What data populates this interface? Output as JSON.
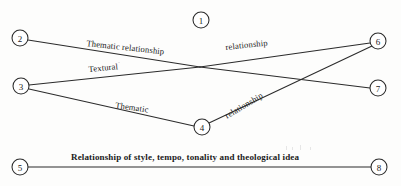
{
  "diagram": {
    "background_color": "#fdfdfc",
    "line_color": "#2b2b2b",
    "text_color": "#1b1b1b",
    "width": 401,
    "height": 186,
    "nodes": [
      {
        "id": "1",
        "label": "1",
        "x": 201,
        "y": 20,
        "r": 8
      },
      {
        "id": "2",
        "label": "2",
        "x": 20,
        "y": 38,
        "r": 8
      },
      {
        "id": "3",
        "label": "3",
        "x": 21,
        "y": 86,
        "r": 8
      },
      {
        "id": "4",
        "label": "4",
        "x": 202,
        "y": 127,
        "r": 8
      },
      {
        "id": "5",
        "label": "5",
        "x": 20,
        "y": 167,
        "r": 8
      },
      {
        "id": "6",
        "label": "6",
        "x": 378,
        "y": 41,
        "r": 8
      },
      {
        "id": "7",
        "label": "7",
        "x": 378,
        "y": 88,
        "r": 8
      },
      {
        "id": "8",
        "label": "8",
        "x": 379,
        "y": 167,
        "r": 8
      }
    ],
    "edges": [
      {
        "id": "edge-2-6",
        "from": "2",
        "to": "6",
        "via_x": 200,
        "via_y": 67,
        "label": "Thematic relationship"
      },
      {
        "id": "edge-3-7",
        "from": "3",
        "to": "7",
        "via_x": 200,
        "via_y": 67,
        "label": "Textural"
      },
      {
        "id": "edge-3-4",
        "from": "3",
        "to": "4",
        "label": "Thematic"
      },
      {
        "id": "edge-4-6",
        "from": "4",
        "to": "6",
        "label": "relationship"
      },
      {
        "id": "edge-5-8",
        "from": "5",
        "to": "8",
        "label": "Relationship of style, tempo, tonality and theological idea"
      }
    ],
    "edge_labels": {
      "thematic_relationship": "Thematic relationship",
      "relationship_upper": "relationship",
      "textural": "Textural",
      "thematic": "Thematic",
      "relationship_lower": "relationship",
      "bottom_relationship": "Relationship of style, tempo, tonality and theological idea"
    }
  }
}
